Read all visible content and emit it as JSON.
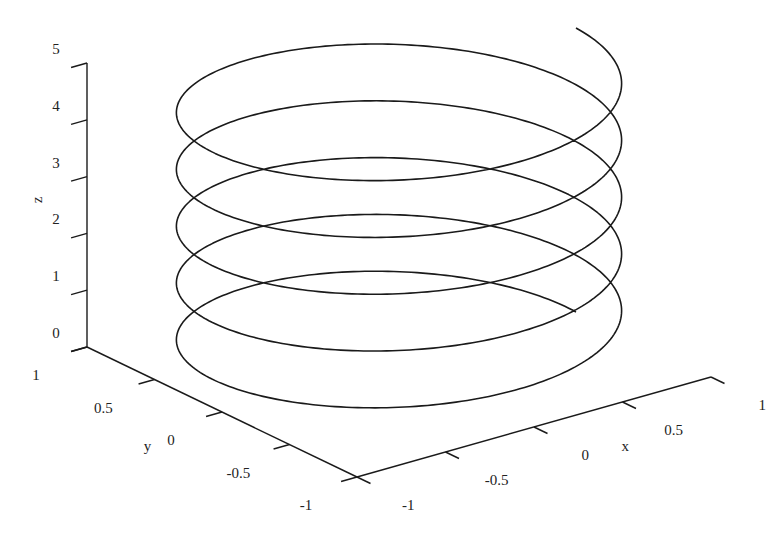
{
  "chart_data": {
    "type": "line3d",
    "title": "",
    "xlabel": "x",
    "ylabel": "y",
    "zlabel": "z",
    "xlim": [
      -1,
      1
    ],
    "ylim": [
      -1,
      1
    ],
    "zlim": [
      0,
      5
    ],
    "x_ticks": [
      "-1",
      "-0.5",
      "0",
      "0.5",
      "1"
    ],
    "y_ticks": [
      "-1",
      "-0.5",
      "0",
      "0.5",
      "1"
    ],
    "z_ticks": [
      "0",
      "1",
      "2",
      "3",
      "4",
      "5"
    ],
    "grid": false,
    "legend": null,
    "series": [
      {
        "name": "helix",
        "color": "#1a1a1a",
        "parametric": {
          "x": "cos(t)",
          "y": "sin(t)",
          "z": "t/(2*pi)",
          "t_range": [
            0,
            31.4159
          ],
          "turns": 5
        },
        "start_point": [
          1,
          0,
          0
        ],
        "end_point": [
          1,
          0,
          5
        ]
      }
    ]
  },
  "projection": {
    "origin_px": [
      357,
      477
    ],
    "x_unit_px": [
      177,
      -50
    ],
    "y_unit_px": [
      -135,
      -65
    ],
    "z_unit_px": [
      0,
      -56.8
    ],
    "origin_data": [
      -1,
      -1,
      0
    ]
  }
}
